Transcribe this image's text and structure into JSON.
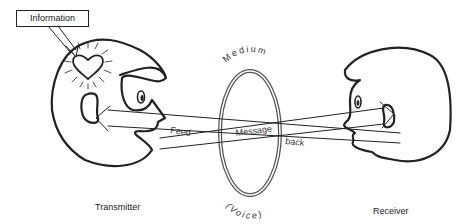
{
  "diagram": {
    "info_label": "Information",
    "medium_label": "Medium",
    "voice_label": "(Voice)",
    "feed_label": "Feed",
    "message_label": "Message",
    "back_label": "back",
    "transmitter_label": "Transmitter",
    "receiver_label": "Receiver",
    "stroke_color": "#222222",
    "background": "#ffffff"
  }
}
